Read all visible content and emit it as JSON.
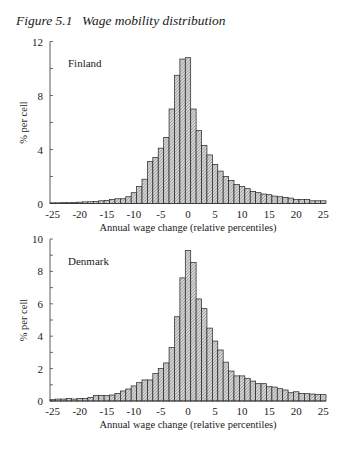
{
  "figure": {
    "number": "Figure 5.1",
    "title": "Wage mobility distribution"
  },
  "colors": {
    "bar_fill": "#c8c8c8",
    "bar_stroke": "#222222",
    "axis": "#333333",
    "text": "#1a1a1a"
  },
  "chart_data": [
    {
      "type": "bar",
      "panel_label": "Finland",
      "title": "",
      "xlabel": "Annual wage change (relative percentiles)",
      "ylabel": "% per cell",
      "ylim": [
        0,
        12
      ],
      "yticks": [
        0,
        4,
        8,
        12
      ],
      "yminor_step": 2,
      "xlim": [
        -25.5,
        25.5
      ],
      "xticks": [
        -25,
        -20,
        -15,
        -10,
        -5,
        0,
        5,
        10,
        15,
        20,
        25
      ],
      "grid": false,
      "legend": "none",
      "bar_pattern": "diagonal hatch",
      "x": [
        -25,
        -24,
        -23,
        -22,
        -21,
        -20,
        -19,
        -18,
        -17,
        -16,
        -15,
        -14,
        -13,
        -12,
        -11,
        -10,
        -9,
        -8,
        -7,
        -6,
        -5,
        -4,
        -3,
        -2,
        -1,
        0,
        1,
        2,
        3,
        4,
        5,
        6,
        7,
        8,
        9,
        10,
        11,
        12,
        13,
        14,
        15,
        16,
        17,
        18,
        19,
        20,
        21,
        22,
        23,
        24,
        25
      ],
      "values": [
        0.05,
        0.05,
        0.06,
        0.06,
        0.08,
        0.1,
        0.12,
        0.13,
        0.15,
        0.2,
        0.22,
        0.3,
        0.35,
        0.35,
        0.5,
        0.8,
        1.25,
        1.8,
        3.1,
        3.4,
        4.1,
        4.9,
        7.0,
        9.5,
        10.7,
        10.8,
        7.0,
        5.4,
        4.3,
        3.6,
        2.9,
        2.4,
        2.0,
        1.7,
        1.4,
        1.25,
        1.1,
        0.9,
        0.8,
        0.7,
        0.65,
        0.55,
        0.5,
        0.45,
        0.4,
        0.3,
        0.3,
        0.3,
        0.2,
        0.2,
        0.2
      ]
    },
    {
      "type": "bar",
      "panel_label": "Denmark",
      "title": "",
      "xlabel": "Annual wage change (relative percentiles)",
      "ylabel": "% per cell",
      "ylim": [
        0,
        10
      ],
      "yticks": [
        0,
        2,
        4,
        6,
        8,
        10
      ],
      "yminor_step": 1,
      "xlim": [
        -25.5,
        25.5
      ],
      "xticks": [
        -25,
        -20,
        -15,
        -10,
        -5,
        0,
        5,
        10,
        15,
        20,
        25
      ],
      "grid": false,
      "legend": "none",
      "bar_pattern": "diagonal hatch",
      "x": [
        -25,
        -24,
        -23,
        -22,
        -21,
        -20,
        -19,
        -18,
        -17,
        -16,
        -15,
        -14,
        -13,
        -12,
        -11,
        -10,
        -9,
        -8,
        -7,
        -6,
        -5,
        -4,
        -3,
        -2,
        -1,
        0,
        1,
        2,
        3,
        4,
        5,
        6,
        7,
        8,
        9,
        10,
        11,
        12,
        13,
        14,
        15,
        16,
        17,
        18,
        19,
        20,
        21,
        22,
        23,
        24,
        25
      ],
      "values": [
        0.08,
        0.12,
        0.12,
        0.16,
        0.12,
        0.16,
        0.16,
        0.22,
        0.35,
        0.35,
        0.33,
        0.37,
        0.47,
        0.62,
        0.74,
        0.93,
        1.13,
        1.3,
        1.3,
        1.7,
        2.0,
        2.35,
        3.3,
        5.2,
        7.6,
        9.3,
        8.55,
        6.3,
        5.7,
        4.5,
        3.7,
        3.15,
        2.4,
        1.85,
        1.55,
        1.55,
        1.4,
        1.23,
        1.07,
        1.07,
        0.88,
        0.86,
        0.76,
        0.68,
        0.51,
        0.57,
        0.47,
        0.45,
        0.43,
        0.41,
        0.39
      ]
    }
  ]
}
